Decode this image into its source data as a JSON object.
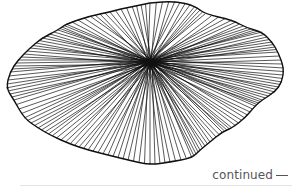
{
  "illustration": {
    "subject": "radial pleated fan / flower line drawing",
    "stroke_color": "#111111",
    "background": "#ffffff",
    "center": [
      150,
      62
    ],
    "outline": [
      [
        150,
        3
      ],
      [
        175,
        1
      ],
      [
        195,
        6
      ],
      [
        205,
        14
      ],
      [
        232,
        20
      ],
      [
        247,
        28
      ],
      [
        262,
        32
      ],
      [
        272,
        42
      ],
      [
        278,
        52
      ],
      [
        284,
        68
      ],
      [
        282,
        82
      ],
      [
        275,
        92
      ],
      [
        262,
        100
      ],
      [
        255,
        106
      ],
      [
        245,
        118
      ],
      [
        232,
        128
      ],
      [
        222,
        132
      ],
      [
        210,
        142
      ],
      [
        200,
        150
      ],
      [
        192,
        158
      ],
      [
        170,
        162
      ],
      [
        150,
        165
      ],
      [
        128,
        160
      ],
      [
        108,
        155
      ],
      [
        88,
        150
      ],
      [
        70,
        144
      ],
      [
        52,
        136
      ],
      [
        38,
        128
      ],
      [
        24,
        118
      ],
      [
        14,
        100
      ],
      [
        6,
        88
      ],
      [
        10,
        72
      ],
      [
        18,
        60
      ],
      [
        30,
        48
      ],
      [
        42,
        38
      ],
      [
        58,
        30
      ],
      [
        66,
        24
      ],
      [
        90,
        16
      ],
      [
        110,
        12
      ],
      [
        132,
        6
      ]
    ]
  },
  "caption": {
    "text": "continued",
    "color": "#555555"
  }
}
